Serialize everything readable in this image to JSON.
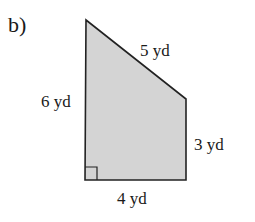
{
  "problem": {
    "part_label": "b)"
  },
  "figure": {
    "shape": "right trapezoid",
    "fill_color": "#d4d4d4",
    "stroke_color": "#222222",
    "right_angle_marker": "bottom-left",
    "sides": {
      "left": "6 yd",
      "top_slant": "5 yd",
      "right": "3 yd",
      "bottom": "4 yd"
    }
  }
}
